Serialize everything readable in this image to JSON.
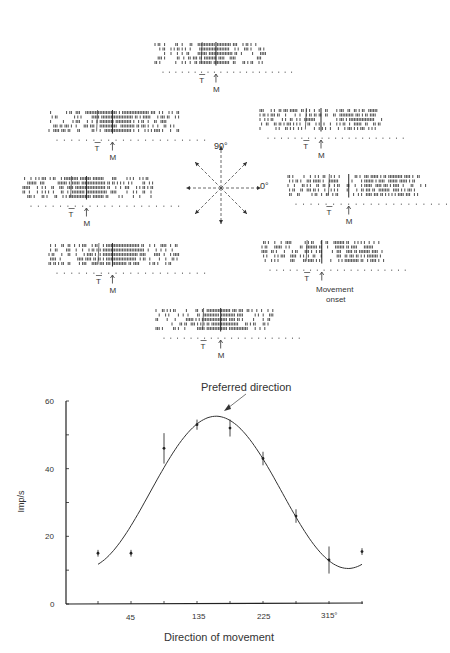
{
  "figure": {
    "compass": {
      "up_label": "90°",
      "right_label": "0°"
    },
    "raster_markers": {
      "target_label": "T",
      "movement_label": "M",
      "movement_onset_label_1": "Movement",
      "movement_onset_label_2": "onset"
    },
    "rasters": [
      {
        "position": "top",
        "direction_deg": 90
      },
      {
        "position": "upper-left",
        "direction_deg": 135
      },
      {
        "position": "left",
        "direction_deg": 180
      },
      {
        "position": "lower-left",
        "direction_deg": 225
      },
      {
        "position": "bottom",
        "direction_deg": 270
      },
      {
        "position": "lower-right",
        "direction_deg": 315
      },
      {
        "position": "right",
        "direction_deg": 0
      },
      {
        "position": "upper-right",
        "direction_deg": 45
      }
    ]
  },
  "chart_data": {
    "type": "scatter",
    "title": "",
    "annotation": "Preferred direction",
    "xlabel": "Direction of movement",
    "ylabel": "Imp/s",
    "x_tick_labels": [
      "45",
      "135",
      "225",
      "315°"
    ],
    "x_ticks": [
      0,
      45,
      90,
      135,
      180,
      225,
      270,
      315,
      360
    ],
    "y_tick_labels": [
      "0",
      "20",
      "40",
      "60"
    ],
    "ylim": [
      0,
      60
    ],
    "xlim": [
      -30,
      360
    ],
    "grid": false,
    "series": [
      {
        "name": "Mean discharge rate",
        "x": [
          0,
          45,
          90,
          135,
          180,
          225,
          270,
          315,
          360
        ],
        "values": [
          15,
          15,
          46,
          53,
          52,
          43,
          26,
          13,
          15.5
        ],
        "error": [
          1,
          1,
          4.5,
          1.5,
          2.5,
          2,
          2,
          4,
          1
        ]
      },
      {
        "name": "Cosine fit",
        "type": "line",
        "x": [
          0,
          45,
          90,
          135,
          161,
          180,
          225,
          270,
          315,
          341,
          360
        ],
        "values": [
          12,
          22,
          41,
          53,
          55.5,
          54,
          43,
          26,
          13,
          11,
          12.5
        ]
      }
    ]
  }
}
